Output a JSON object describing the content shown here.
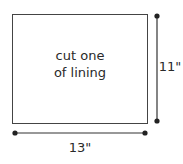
{
  "pattern_piece": {
    "instruction_line1": "cut one",
    "instruction_line2": "of lining"
  },
  "dimensions": {
    "width_label": "13\"",
    "height_label": "11\""
  },
  "colors": {
    "line": "#333333",
    "background": "#ffffff"
  }
}
